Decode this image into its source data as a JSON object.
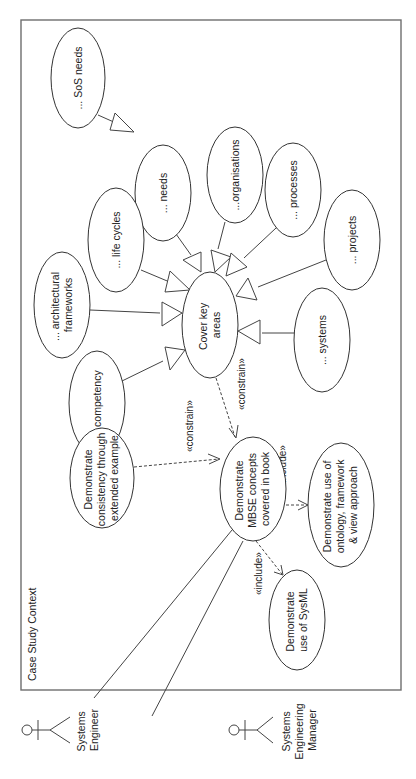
{
  "frame": {
    "title": "Case Study Context"
  },
  "actors": [
    {
      "id": "systems-engineer",
      "lines": [
        "Systems",
        "Engineer"
      ]
    },
    {
      "id": "systems-engineering-manager",
      "lines": [
        "Systems",
        "Engineering",
        "Manager"
      ]
    }
  ],
  "use_cases": {
    "sos_needs": {
      "lines": [
        "... SoS needs"
      ]
    },
    "needs": {
      "lines": [
        "... needs"
      ]
    },
    "life_cycles": {
      "lines": [
        "... life cycles"
      ]
    },
    "architectural_frameworks": {
      "lines": [
        "... architectural",
        "frameworks"
      ]
    },
    "organisations": {
      "lines": [
        "...organisations"
      ]
    },
    "processes": {
      "lines": [
        "... processes"
      ]
    },
    "projects": {
      "lines": [
        "... projects"
      ]
    },
    "systems": {
      "lines": [
        "... systems"
      ]
    },
    "competency": {
      "lines": [
        "...competency"
      ]
    },
    "cover_key_areas": {
      "lines": [
        "Cover key",
        "areas"
      ]
    },
    "demonstrate_consistency": {
      "lines": [
        "Demonstrate",
        "consistency through",
        "extended example"
      ]
    },
    "demonstrate_mbse": {
      "lines": [
        "Demonstrate",
        "MBSE concepts",
        "covered in book"
      ]
    },
    "demonstrate_sysml": {
      "lines": [
        "Demonstrate",
        "use of SysML"
      ]
    },
    "demonstrate_ontology": {
      "lines": [
        "Demonstrate use of",
        "ontology, framework",
        "& view approach"
      ]
    }
  },
  "relationships": {
    "generalisations": [
      {
        "from": "sos_needs",
        "to": "needs"
      },
      {
        "from": "needs",
        "to": "cover_key_areas"
      },
      {
        "from": "life_cycles",
        "to": "cover_key_areas"
      },
      {
        "from": "architectural_frameworks",
        "to": "cover_key_areas"
      },
      {
        "from": "competency",
        "to": "cover_key_areas"
      },
      {
        "from": "organisations",
        "to": "cover_key_areas"
      },
      {
        "from": "processes",
        "to": "cover_key_areas"
      },
      {
        "from": "projects",
        "to": "cover_key_areas"
      },
      {
        "from": "systems",
        "to": "cover_key_areas"
      }
    ],
    "dependencies": [
      {
        "from": "cover_key_areas",
        "to": "demonstrate_mbse",
        "stereotype": "«constrain»"
      },
      {
        "from": "demonstrate_consistency",
        "to": "demonstrate_mbse",
        "stereotype": "«constrain»"
      },
      {
        "from": "demonstrate_mbse",
        "to": "demonstrate_ontology",
        "stereotype": "«include»"
      },
      {
        "from": "demonstrate_mbse",
        "to": "demonstrate_sysml",
        "stereotype": "«include»"
      }
    ],
    "associations": [
      {
        "actor": "systems-engineer",
        "use_case": "demonstrate_mbse"
      },
      {
        "actor": "systems-engineering-manager",
        "use_case": "demonstrate_mbse"
      }
    ],
    "labels": {
      "constrain_top": "«constrain»",
      "constrain_left": "«constrain»",
      "include_right": "«include»",
      "include_bottom": "«include»"
    }
  },
  "colors": {
    "stroke": "#333333",
    "frame": "#6e6e6e",
    "background": "#ffffff",
    "text": "#222222"
  }
}
